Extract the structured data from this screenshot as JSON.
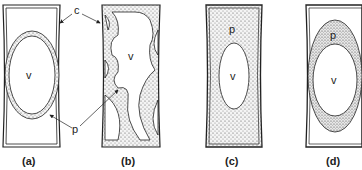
{
  "figure": {
    "panels": [
      {
        "id": "a",
        "caption": "(a)",
        "vacuole_label": "v",
        "description": "Cell with large central vacuole and thin peripheral cytoplasm layer"
      },
      {
        "id": "b",
        "caption": "(b)",
        "vacuole_label": "v",
        "description": "Cell with cytoplasmic strands crossing the vacuole"
      },
      {
        "id": "c",
        "caption": "(c)",
        "vacuole_label": "v",
        "protoplasm_label": "p",
        "description": "Cell filled with protoplasm, small vacuole"
      },
      {
        "id": "d",
        "caption": "(d)",
        "vacuole_label": "v",
        "protoplasm_label": "p",
        "description": "Plasmolysed cell; protoplast shrunk away from wall"
      }
    ],
    "labels": {
      "cell_wall": "c",
      "protoplasm": "p"
    },
    "colors": {
      "line": "#222222",
      "stipple": "#555555",
      "background": "#ffffff"
    }
  }
}
